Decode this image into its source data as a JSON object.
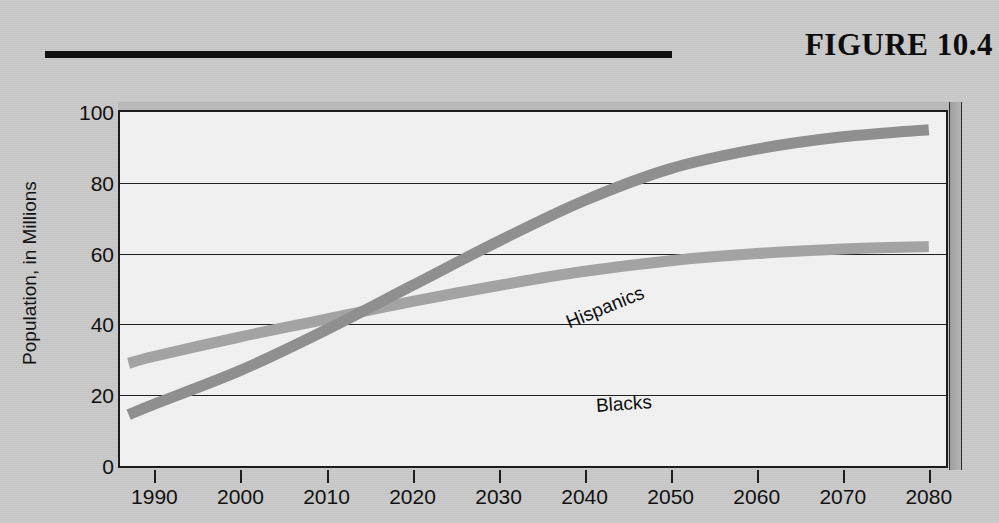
{
  "figure": {
    "title": "FIGURE 10.4",
    "rule": "horizontal-rule"
  },
  "chart_data": {
    "type": "line",
    "title": "FIGURE 10.4",
    "xlabel": "",
    "ylabel": "Population, in Millions",
    "xlim": [
      1986,
      2082
    ],
    "ylim": [
      0,
      100
    ],
    "grid": true,
    "legend": "inline-labels",
    "xticks": [
      "1990",
      "2000",
      "2010",
      "2020",
      "2030",
      "2040",
      "2050",
      "2060",
      "2070",
      "2080"
    ],
    "xtick_values": [
      1990,
      2000,
      2010,
      2020,
      2030,
      2040,
      2050,
      2060,
      2070,
      2080
    ],
    "yticks": [
      "0",
      "20",
      "40",
      "60",
      "80",
      "100"
    ],
    "ytick_values": [
      0,
      20,
      40,
      60,
      80,
      100
    ],
    "x": [
      1987,
      1990,
      2000,
      2010,
      2020,
      2030,
      2040,
      2050,
      2060,
      2070,
      2080
    ],
    "series": [
      {
        "name": "Hispanics",
        "color": "#8f8f8f",
        "values": [
          14.5,
          17.5,
          27.0,
          38.5,
          51.0,
          63.5,
          75.0,
          84.0,
          89.5,
          93.0,
          95.0
        ]
      },
      {
        "name": "Blacks",
        "color": "#a3a3a3",
        "values": [
          29.0,
          31.0,
          36.5,
          41.5,
          46.5,
          51.0,
          55.0,
          58.0,
          60.0,
          61.3,
          62.0
        ]
      }
    ],
    "annotations": [
      {
        "text": "Hispanics",
        "x": 2027,
        "y": 68,
        "rotation": -22
      },
      {
        "text": "Blacks",
        "x": 2031,
        "y": 48,
        "rotation": -4
      }
    ],
    "colors": {
      "background": "#c9c9c9",
      "plot_background": "#f1f1f1",
      "axis": "#1c1c1c",
      "text": "#111111"
    }
  }
}
